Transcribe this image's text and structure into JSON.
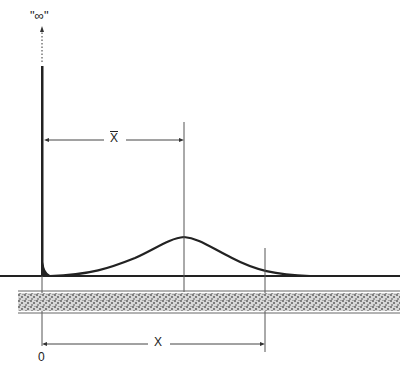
{
  "figure": {
    "infinity_label": "\"∞\"",
    "mean_label": "X",
    "distance_label": "X",
    "origin_label": "0",
    "caption_visible": "(caption text cut off at bottom edge — unreadable)"
  },
  "colors": {
    "ink": "#222222",
    "thin_line": "#555555",
    "band_fill": "#9a9a9a",
    "background": "#ffffff"
  },
  "elements": {
    "spike": {
      "x": 42,
      "top_y": 68,
      "dotted_top_y": 28,
      "baseline_y": 276
    },
    "baseline": {
      "y": 276,
      "x_start": 0,
      "x_end": 400
    },
    "bell_curve": {
      "peak_x": 184,
      "peak_y": 237,
      "left_tail_x": 50,
      "right_tail_x": 305
    },
    "mean_line": {
      "x": 184,
      "y_top": 122,
      "y_bottom": 292
    },
    "distance_line": {
      "x": 265,
      "y_top": 248,
      "y_bottom": 352
    },
    "stippled_band": {
      "x_start": 18,
      "x_end": 400,
      "y_top": 292,
      "y_bottom": 312
    },
    "mean_arrow": {
      "y": 140,
      "x_start": 44,
      "x_end": 184
    },
    "distance_arrow": {
      "y": 344,
      "x_start": 42,
      "x_end": 265
    }
  }
}
